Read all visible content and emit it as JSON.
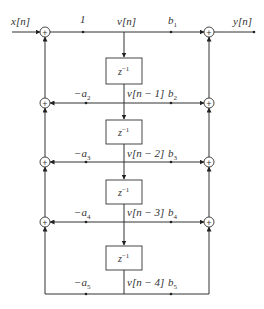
{
  "diagram": {
    "input_label": "x[n]",
    "output_label": "y[n]",
    "top_gain": "1",
    "delay_label": "z",
    "delay_exp": "−1",
    "rows": [
      {
        "node": "v[n]",
        "feedback": "",
        "feedforward": "b",
        "ff_sub": "1"
      },
      {
        "node": "v[n − 1]",
        "feedback": "−a",
        "fb_sub": "2",
        "feedforward": "b",
        "ff_sub": "2"
      },
      {
        "node": "v[n − 2]",
        "feedback": "−a",
        "fb_sub": "3",
        "feedforward": "b",
        "ff_sub": "3"
      },
      {
        "node": "v[n − 3]",
        "feedback": "−a",
        "fb_sub": "4",
        "feedforward": "b",
        "ff_sub": "4"
      },
      {
        "node": "v[n − 4]",
        "feedback": "−a",
        "fb_sub": "5",
        "feedforward": "b",
        "ff_sub": "5"
      }
    ],
    "adder_symbol": "+"
  }
}
